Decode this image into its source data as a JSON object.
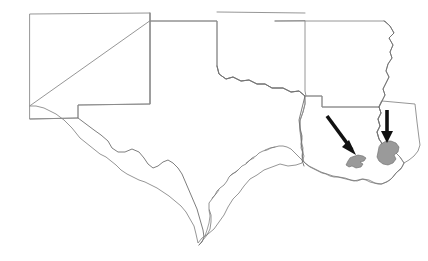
{
  "figure": {
    "kind": "reference-map",
    "width": 428,
    "height": 261,
    "background_color": "#ffffff"
  },
  "style": {
    "boundary_color": "#8a8a8a",
    "boundary_width": 0.9,
    "coast_color": "#777777",
    "coast_width": 0.8,
    "river_color": "#6f6f6f",
    "river_width": 0.9,
    "urban_fill": "#9a9a9a",
    "urban_stroke": "#6a6a6a",
    "urban_stroke_width": 0.6,
    "arrow_color": "#111111",
    "arrow_shaft_width": 3.6
  },
  "states": [
    {
      "id": "new-mexico",
      "name": "New Mexico",
      "outline": "M 30,14 L 150,13 L 150,104 L 78,105 L 78,118 L 30,119 Z"
    },
    {
      "id": "texas-panhandle-and-body",
      "name": "Texas",
      "outline": "M 150,13 L 150,104 L 78,105 L 78,118 L 30,119 L 30,119 M 150,13 L 150,104 M 150,21 L 217,21 L 217,66 L 219,74 L 226,79 L 233,77 L 241,81 L 249,80 L 257,84 L 265,84 L 272,88 L 283,88 L 291,92 L 299,91 L 305,96 L 305,104 L 303,112 L 300,120 L 300,130 L 302,139 L 301,148 L 304,156 L 302,163 L 296,165 L 288,166 L 280,164 L 272,167 L 264,170 L 257,175 L 250,179 L 244,186 L 239,193 L 233,199 L 228,207 L 224,215 L 219,222 L 214,229 L 208,234 L 202,238 L 198,243 L 196,234 L 194,226 L 190,219 L 186,212 L 181,206 L 175,201 L 169,196 L 163,192 L 157,188 L 151,185 L 145,182 L 139,180 L 133,177 L 127,174 L 121,170 L 116,165 L 111,161 L 106,157 L 100,154 L 95,150 L 90,146 L 85,142 L 80,138 L 76,133 L 72,128 L 68,124 L 64,120 L 60,117 L 56,114 L 52,112 L 48,110 L 44,108 L 40,107 L 36,106 L 32,106 L 30,106 Z"
    },
    {
      "id": "oklahoma",
      "name": "Oklahoma",
      "outline": "M 150,21 L 217,21 L 217,66 L 219,74 L 226,79 L 233,77 L 241,81 L 249,80 L 257,84 L 265,84 L 272,88 L 283,88 L 291,92 L 299,91 L 305,96 L 305,96 M 217,12 L 305,13"
    },
    {
      "id": "arkansas",
      "name": "Arkansas",
      "outline": "M 275,21 L 385,21 L 390,26 L 394,33 L 389,38 L 393,45 L 390,52 L 392,58 L 388,64 L 386,71 L 389,77 L 386,83 L 383,89 L 385,95 L 382,101 L 379,107 L 322,107 L 322,96 L 306,96 L 305,91 L 305,21 Z"
    },
    {
      "id": "louisiana",
      "name": "Louisiana",
      "outline": "M 305,96 L 322,96 L 322,107 L 379,107 L 381,113 L 378,119 L 380,126 L 377,132 L 379,139 L 383,145 L 389,149 L 395,152 L 400,157 L 404,163 L 401,169 L 396,173 L 392,178 L 387,182 L 381,184 L 375,183 L 369,180 L 363,179 L 357,181 L 351,180 L 345,178 L 339,177 L 333,176 L 327,174 L 321,172 L 315,169 L 309,166 L 304,162 L 302,156 L 303,148 L 301,140 L 300,131 L 300,121 L 303,112 L 305,104 Z"
    },
    {
      "id": "mississippi",
      "name": "Mississippi",
      "outline": "M 379,107 L 381,113 L 378,119 L 380,126 L 377,132 L 379,139 L 383,145 L 389,149 L 395,152 L 400,157 L 404,163 L 409,160 L 414,156 L 418,151 L 420,145 L 419,138 L 418,130 L 417,122 L 416,113 L 415,104 L 382,101 Z"
    }
  ],
  "rivers": [
    {
      "id": "mississippi-river",
      "name": "Mississippi River",
      "path": "M 384,21 L 390,26 L 394,33 L 389,38 L 393,45 L 390,52 L 392,58 L 388,64 L 386,71 L 389,77 L 386,83 L 383,89 L 385,95 L 382,101 L 379,107 L 381,113 L 378,119 L 380,126 L 377,132 L 379,139 L 383,145"
    },
    {
      "id": "rio-grande",
      "name": "Rio Grande",
      "path": "M 78,118 L 86,124 L 94,130 L 101,135 L 108,141 L 112,148 L 118,152 L 125,152 L 132,149 L 139,152 L 144,158 L 148,164 L 153,168 L 158,166 L 163,162 L 168,160 L 173,163 L 178,168 L 182,174 L 185,181 L 188,188 L 191,195 L 194,202 L 197,209 L 199,216 L 201,223 L 203,230 L 204,237 L 202,242 L 199,245"
    },
    {
      "id": "sabine-river",
      "name": "Sabine River",
      "path": "M 305,96 L 303,104 L 301,112 L 299,120 L 300,128 L 302,136 L 301,144 L 303,152 L 302,160 L 304,166"
    },
    {
      "id": "red-river",
      "name": "Red River",
      "path": "M 217,66 L 219,74 L 226,79 L 233,77 L 241,81 L 249,80 L 257,84 L 265,84 L 272,88 L 283,88 L 291,92 L 299,91 L 305,96"
    }
  ],
  "coastline": {
    "id": "gulf-coast",
    "name": "Gulf of Mexico coastline",
    "path": "M 199,245 L 203,240 L 207,235 L 210,229 L 211,222 L 211,215 L 209,209 L 209,203 L 212,199 L 215,195 L 217,191 L 220,188 L 224,185 L 227,181 L 229,177 L 232,174 L 236,172 L 239,169 L 242,166 L 246,164 L 249,161 L 252,158 L 256,156 L 259,153 L 263,151 L 267,150 L 271,148 L 275,147 L 279,146 L 283,146 L 287,147 L 291,149 L 294,152 L 297,155 L 300,158 L 303,161 L 306,164 L 310,167 L 314,169 L 318,171 L 322,173 L 326,174 L 330,176 L 334,177 L 338,177 L 342,178 L 346,179 L 350,180 L 354,181 L 358,180 L 362,179 L 366,180 L 370,182 L 374,183 L 378,184 L 382,184 L 386,182 L 390,180 L 393,177 L 396,173 L 399,170 L 402,167 L 404,163",
    "barrier_islands": [
      "M 205,236 L 207,230 L 209,223 L 210,216 L 209,210",
      "M 212,198 L 216,194 L 219,190",
      "M 230,176 L 234,173 L 238,170",
      "M 246,163 L 250,160 L 254,158",
      "M 265,150 L 270,148 L 275,147"
    ]
  },
  "urban_areas": [
    {
      "id": "urban-area-lake-charles",
      "name": "highlighted urban area west",
      "fill": "#9a9a9a",
      "path": "M 352,157 L 358,155 L 363,156 L 366,158 L 364,161 L 360,162 L 363,164 L 361,167 L 356,168 L 352,166 L 349,167 L 346,165 L 348,161 L 350,158 Z"
    },
    {
      "id": "urban-area-new-orleans",
      "name": "highlighted urban area east",
      "fill": "#9a9a9a",
      "path": "M 381,144 L 386,141 L 391,141 L 396,143 L 399,147 L 398,152 L 394,155 L 396,159 L 393,163 L 388,165 L 383,164 L 379,161 L 377,157 L 378,152 L 379,147 Z"
    }
  ],
  "annotations": [
    {
      "id": "arrow-west",
      "name": "arrow pointing to west urban area",
      "orientation": "diagonal-down-right",
      "shaft": {
        "x1": 327,
        "y1": 116,
        "x2": 352,
        "y2": 150
      },
      "head": "M 352,150 L 342,145 L 348,141 Z",
      "head_points": "356,155 342,147 349,140"
    },
    {
      "id": "arrow-east",
      "name": "arrow pointing to east urban area",
      "orientation": "vertical-down",
      "shaft": {
        "x1": 387,
        "y1": 110,
        "x2": 387,
        "y2": 138
      },
      "head": "M 387,143 L 381,132 L 393,132 Z",
      "head_points": "387,143 381,131 393,131"
    }
  ]
}
